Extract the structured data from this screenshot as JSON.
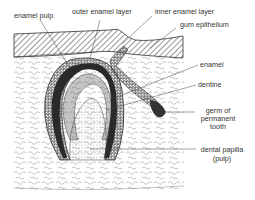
{
  "figure": {
    "labels": {
      "enamel_pulp": "enamel pulp",
      "outer_enamel_layer": "outer enamel layer",
      "inner_enamel_layer": "inner enamel layer",
      "gum_epithelium": "gum epithelium",
      "enamel": "enamel",
      "dentine": "dentine",
      "germ_permanent_line1": "germ of",
      "germ_permanent_line2": "permanent",
      "germ_permanent_line3": "tooth",
      "dental_papilla_line1": "dental papilla",
      "dental_papilla_line2": "(pulp)"
    },
    "colors": {
      "ink": "#333333",
      "background": "#ffffff"
    }
  }
}
